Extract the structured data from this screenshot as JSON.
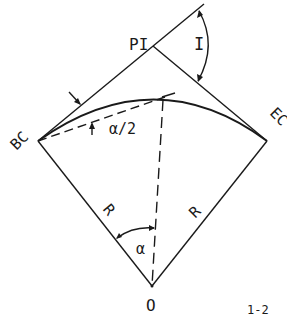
{
  "diagram": {
    "labels": {
      "pi": "PI",
      "i": "I",
      "bc": "BC",
      "ec": "EC",
      "alpha_half": "α/2",
      "r_left": "R",
      "r_right": "R",
      "alpha": "α",
      "o": "O",
      "figure_number": "1-2"
    },
    "stroke_color": "#1a1a1a",
    "background": "#ffffff"
  }
}
